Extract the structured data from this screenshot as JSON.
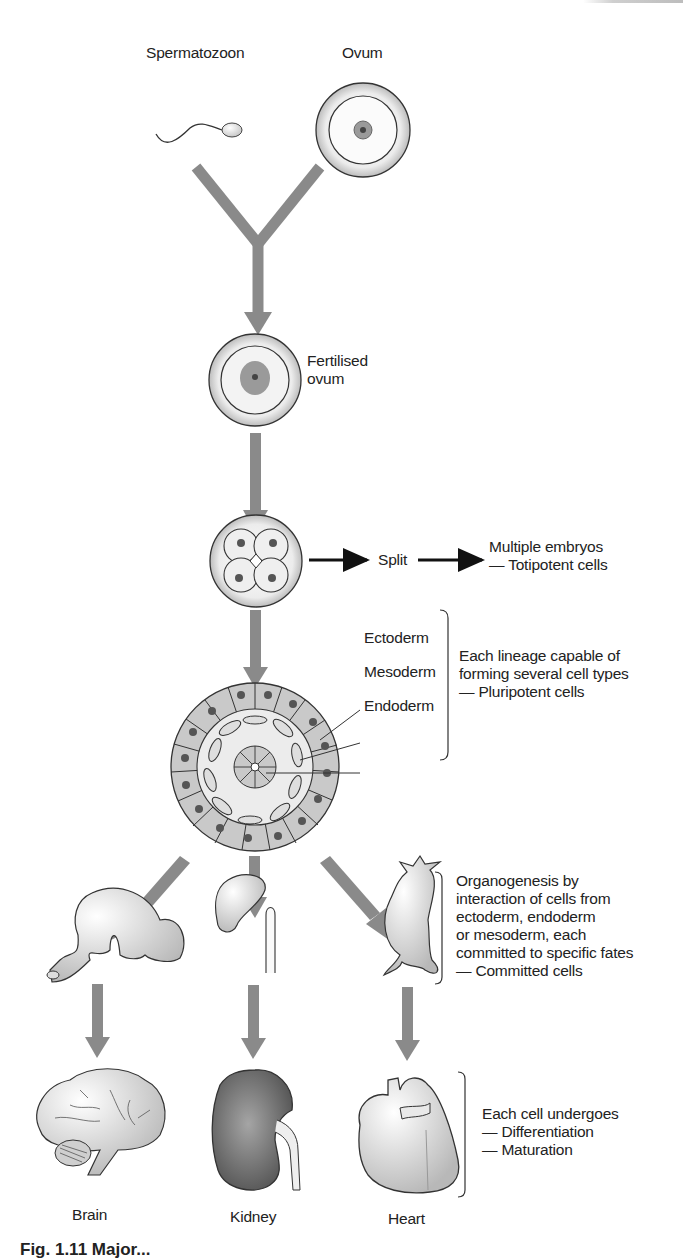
{
  "figure": {
    "labels": {
      "spermatozoon": "Spermatozoon",
      "ovum": "Ovum",
      "fertilised_ovum_line1": "Fertilised",
      "fertilised_ovum_line2": "ovum",
      "split": "Split",
      "multiple_embryos": "Multiple embryos",
      "totipotent": "— Totipotent cells",
      "ectoderm": "Ectoderm",
      "mesoderm": "Mesoderm",
      "endoderm": "Endoderm",
      "brain": "Brain",
      "kidney": "Kidney",
      "heart": "Heart"
    },
    "notes": {
      "pluripotent": [
        "Each lineage capable of",
        "forming several cell types",
        "— Pluripotent cells"
      ],
      "committed": [
        "Organogenesis by",
        "interaction of cells from",
        "ectoderm, endoderm",
        "or mesoderm, each",
        "committed to specific fates",
        "— Committed cells"
      ],
      "differentiation": [
        "Each cell undergoes",
        "— Differentiation",
        "— Maturation"
      ]
    },
    "caption": "Fig. 1.11  Major..."
  },
  "colors": {
    "arrow": "#8a8a8a",
    "black_arrow": "#111111",
    "cell_fill": "#c9c9c9",
    "nucleus": "#555555",
    "kidney": "#7a7a7a"
  }
}
